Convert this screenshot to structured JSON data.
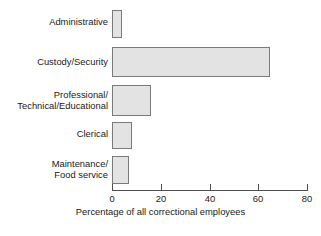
{
  "chart_data": {
    "type": "bar",
    "orientation": "horizontal",
    "title": "",
    "subtitle": "",
    "xlabel": "Percentage of all correctional employees",
    "ylabel": "",
    "categories": [
      "Administrative",
      "Custody/Security",
      "Professional/\nTechnical/Educational",
      "Clerical",
      "Maintenance/\nFood service"
    ],
    "values": [
      4,
      65,
      16,
      8,
      7
    ],
    "xlim": [
      0,
      80
    ],
    "ylim": null,
    "xticks": [
      0,
      20,
      40,
      60,
      80
    ],
    "xtick_labels": [
      "0",
      "20",
      "40",
      "60",
      "80"
    ],
    "grid": false,
    "legend": null,
    "series": [
      {
        "name": "Percentage of all correctional employees",
        "values": [
          4,
          65,
          16,
          8,
          7
        ]
      }
    ],
    "colors": {
      "bar_fill": "#e3e3e3",
      "bar_border": "#7a7a7a",
      "axis": "#4d4d4d",
      "text": "#1a1a1a",
      "background": "#ffffff"
    }
  },
  "axis": {
    "title": "Percentage of all correctional employees",
    "ticks": [
      {
        "value": 0,
        "label": "0"
      },
      {
        "value": 20,
        "label": "20"
      },
      {
        "value": 40,
        "label": "40"
      },
      {
        "value": 60,
        "label": "60"
      },
      {
        "value": 80,
        "label": "80"
      }
    ]
  },
  "bars": [
    {
      "label": "Administrative",
      "value": 4,
      "top": 10,
      "height": 28
    },
    {
      "label": "Custody/Security",
      "value": 65,
      "top": 47,
      "height": 30
    },
    {
      "label": "Professional/\nTechnical/Educational",
      "value": 16,
      "top": 85,
      "height": 31
    },
    {
      "label": "Clerical",
      "value": 8,
      "top": 122,
      "height": 27
    },
    {
      "label": "Maintenance/\nFood service",
      "value": 7,
      "top": 156,
      "height": 28
    }
  ]
}
